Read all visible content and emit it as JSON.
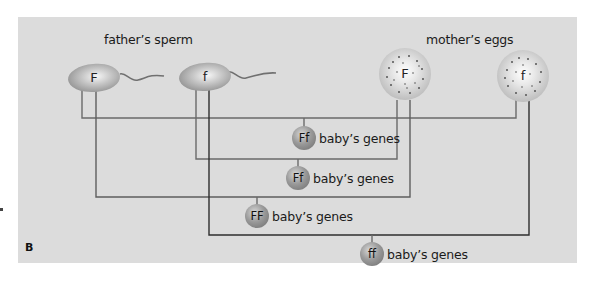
{
  "figure": {
    "panel_label": "B",
    "panel_background": "#dcdcdc",
    "line_color": "#5a5a5a"
  },
  "father": {
    "title": "father’s sperm",
    "sperm": [
      {
        "allele": "F"
      },
      {
        "allele": "f"
      }
    ]
  },
  "mother": {
    "title": "mother’s eggs",
    "eggs": [
      {
        "allele": "F"
      },
      {
        "allele": "f"
      }
    ]
  },
  "offspring": [
    {
      "genotype": "Ff",
      "label": "baby’s genes",
      "from_sperm": "F",
      "from_egg": "f"
    },
    {
      "genotype": "Ff",
      "label": "baby’s genes",
      "from_sperm": "f",
      "from_egg": "F"
    },
    {
      "genotype": "FF",
      "label": "baby’s genes",
      "from_sperm": "F",
      "from_egg": "F"
    },
    {
      "genotype": "ff",
      "label": "baby’s genes",
      "from_sperm": "f",
      "from_egg": "f"
    }
  ]
}
